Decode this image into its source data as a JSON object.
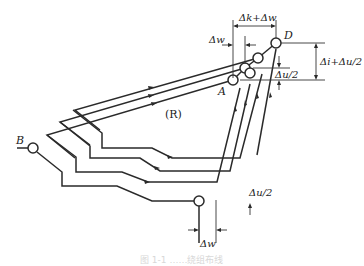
{
  "diagram": {
    "type": "winding-layout",
    "region_label": "(R)",
    "points": {
      "A": "A",
      "B": "B",
      "D": "D"
    },
    "dimensions": {
      "top_width": "Δk+Δw",
      "top_offset": "Δw",
      "right_height": "Δi+Δu/2",
      "right_step": "Δu/2",
      "bottom_step": "Δu/2",
      "bottom_width": "Δw"
    },
    "caption": "图 1-1  ……绕组布线"
  }
}
